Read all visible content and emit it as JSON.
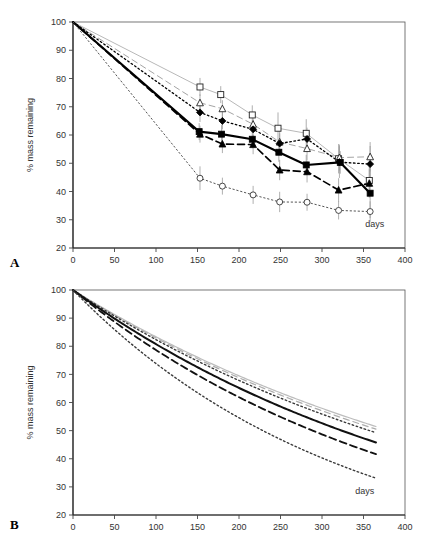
{
  "figure": {
    "panels": [
      {
        "id": "A",
        "label": "A"
      },
      {
        "id": "B",
        "label": "B"
      }
    ]
  },
  "chart_data": [
    {
      "type": "line",
      "panel": "A",
      "title": "",
      "subtitle": "",
      "xlabel": "days",
      "ylabel": "% mass remaining",
      "xlim": [
        0,
        400
      ],
      "ylim": [
        20,
        100
      ],
      "xticks": [
        0,
        50,
        100,
        150,
        200,
        250,
        300,
        350,
        400
      ],
      "yticks": [
        20,
        30,
        40,
        50,
        60,
        70,
        80,
        90,
        100
      ],
      "xtick_labels": [
        "0",
        "50",
        "100",
        "150",
        "200",
        "250",
        "300",
        "350",
        "400"
      ],
      "ytick_labels": [
        "20",
        "30",
        "40",
        "50",
        "60",
        "70",
        "80",
        "90",
        "100"
      ],
      "grid": false,
      "legend": "none",
      "error_bars": true,
      "annotations": [
        {
          "text": "days",
          "x": 352,
          "y": 27.5
        }
      ],
      "series": [
        {
          "name": "open-square",
          "marker": "open-square",
          "line_style": "solid",
          "line_color": "#b0b0b0",
          "line_width": 0.9,
          "x": [
            0,
            153,
            178,
            216,
            247,
            281,
            320,
            357
          ],
          "values": [
            100,
            77.0,
            74.3,
            67.1,
            62.4,
            60.6,
            51.6,
            43.9
          ],
          "error": [
            0,
            3.2,
            3.0,
            3.4,
            5.6,
            5.0,
            5.2,
            6.0
          ]
        },
        {
          "name": "open-triangle",
          "marker": "open-triangle",
          "line_style": "dashed",
          "line_color": "#9a9a9a",
          "line_width": 0.9,
          "x": [
            0,
            153,
            180,
            217,
            249,
            282,
            321,
            358
          ],
          "values": [
            100,
            71.4,
            69.3,
            63.8,
            57.5,
            55.2,
            52.0,
            52.3
          ],
          "error": [
            0,
            3.0,
            3.0,
            3.0,
            4.0,
            4.2,
            4.6,
            5.2
          ]
        },
        {
          "name": "filled-diamond",
          "marker": "filled-diamond",
          "line_style": "dotted",
          "line_color": "#000000",
          "line_width": 1.3,
          "x": [
            0,
            153,
            180,
            217,
            249,
            282,
            321,
            358
          ],
          "values": [
            100,
            68.0,
            65.0,
            62.0,
            57.0,
            58.6,
            50.4,
            49.7
          ],
          "error": [
            0,
            3.4,
            3.0,
            3.2,
            3.6,
            4.0,
            5.6,
            6.4
          ]
        },
        {
          "name": "filled-square",
          "marker": "filled-square",
          "line_style": "solid",
          "line_color": "#000000",
          "line_width": 2.1,
          "x": [
            0,
            152,
            179,
            216,
            248,
            281,
            322,
            358
          ],
          "values": [
            100,
            61.2,
            60.3,
            58.5,
            53.9,
            49.4,
            50.3,
            39.4
          ],
          "error": [
            0,
            3.0,
            3.2,
            3.2,
            3.4,
            3.6,
            4.0,
            8.8
          ]
        },
        {
          "name": "filled-triangle",
          "marker": "filled-triangle",
          "line_style": "dashed",
          "line_color": "#000000",
          "line_width": 1.7,
          "x": [
            0,
            153,
            180,
            217,
            249,
            282,
            320,
            357
          ],
          "values": [
            100,
            60.3,
            56.8,
            56.6,
            47.6,
            47.0,
            40.5,
            42.9
          ],
          "error": [
            0,
            3.0,
            3.2,
            3.4,
            3.6,
            3.8,
            4.2,
            5.0
          ]
        },
        {
          "name": "open-circle",
          "marker": "open-circle",
          "line_style": "dotted",
          "line_color": "#555555",
          "line_width": 1.0,
          "x": [
            0,
            153,
            180,
            217,
            249,
            282,
            320,
            358
          ],
          "values": [
            100,
            44.7,
            41.9,
            38.8,
            36.3,
            36.2,
            33.3,
            32.9
          ],
          "error": [
            0,
            4.2,
            3.0,
            3.2,
            3.6,
            3.0,
            3.2,
            3.6
          ]
        }
      ]
    },
    {
      "type": "line",
      "panel": "B",
      "title": "",
      "subtitle": "",
      "xlabel": "days",
      "ylabel": "% mass remaining",
      "xlim": [
        0,
        400
      ],
      "ylim": [
        20,
        100
      ],
      "xticks": [
        0,
        50,
        100,
        150,
        200,
        250,
        300,
        350,
        400
      ],
      "yticks": [
        20,
        30,
        40,
        50,
        60,
        70,
        80,
        90,
        100
      ],
      "xtick_labels": [
        "0",
        "50",
        "100",
        "150",
        "200",
        "250",
        "300",
        "350",
        "400"
      ],
      "ytick_labels": [
        "20",
        "30",
        "40",
        "50",
        "60",
        "70",
        "80",
        "90",
        "100"
      ],
      "grid": false,
      "legend": "none",
      "error_bars": false,
      "annotations": [
        {
          "text": "days",
          "x": 340,
          "y": 27.5
        }
      ],
      "note": "fitted exponential decay curves y = 100*exp(-k*t), t from 0 to 365",
      "series": [
        {
          "name": "curve-open-square",
          "line_style": "solid",
          "line_color": "#bdbdbd",
          "line_width": 1.2,
          "decay_k": 0.00182,
          "t_end": 365,
          "y_end": 51.5
        },
        {
          "name": "curve-open-triangle",
          "line_style": "dashed",
          "line_color": "#adadad",
          "line_width": 1.2,
          "decay_k": 0.00187,
          "t_end": 365,
          "y_end": 50.5
        },
        {
          "name": "curve-filled-diamond",
          "line_style": "dotted",
          "line_color": "#3a3a3a",
          "line_width": 1.4,
          "decay_k": 0.00194,
          "t_end": 365,
          "y_end": 49.2
        },
        {
          "name": "curve-filled-square",
          "line_style": "solid",
          "line_color": "#111111",
          "line_width": 2.0,
          "decay_k": 0.00214,
          "t_end": 365,
          "y_end": 45.7
        },
        {
          "name": "curve-filled-triangle",
          "line_style": "dashed",
          "line_color": "#111111",
          "line_width": 1.8,
          "decay_k": 0.0024,
          "t_end": 365,
          "y_end": 41.6
        },
        {
          "name": "curve-open-circle",
          "line_style": "dotted",
          "line_color": "#3a3a3a",
          "line_width": 1.4,
          "decay_k": 0.00303,
          "t_end": 365,
          "y_end": 33.1
        }
      ]
    }
  ]
}
